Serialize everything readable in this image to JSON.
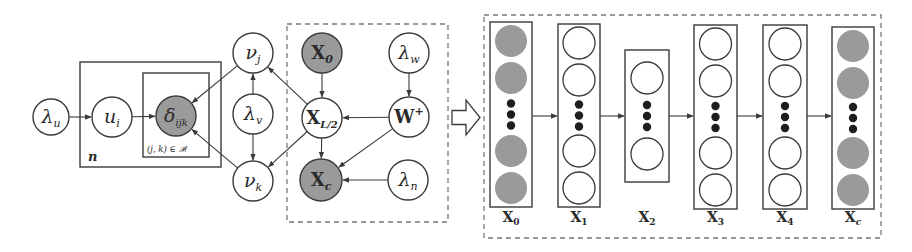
{
  "colors": {
    "stroke": "#3a3a3a",
    "observed_fill": "#9a9a9a",
    "latent_fill": "#ffffff",
    "dot": "#1e1e1e",
    "dash": "#7a7a7a"
  },
  "graphical_model": {
    "plates": [
      {
        "id": "outer",
        "label": "n",
        "x": 80,
        "y": 62,
        "w": 141,
        "h": 105
      },
      {
        "id": "inner",
        "label": "(j, k) ∈ 𝒫ᵢ",
        "x": 143,
        "y": 73,
        "w": 66,
        "h": 84
      }
    ],
    "dashed_box": {
      "x": 287,
      "y": 24,
      "w": 161,
      "h": 198
    },
    "nodes": [
      {
        "id": "lambda_u",
        "main": "λ",
        "sub": "u",
        "cx": 51,
        "cy": 117,
        "r": 18,
        "observed": false
      },
      {
        "id": "u_i",
        "main": "u",
        "sub": "i",
        "cx": 112,
        "cy": 117,
        "r": 20,
        "observed": false
      },
      {
        "id": "delta_ijk",
        "main": "δ",
        "sub": "ijk",
        "cx": 176,
        "cy": 116,
        "r": 20,
        "observed": true
      },
      {
        "id": "v_j",
        "main": "ν",
        "sub": "j",
        "cx": 253,
        "cy": 53,
        "r": 20,
        "observed": false
      },
      {
        "id": "lambda_v",
        "main": "λ",
        "sub": "v",
        "cx": 253,
        "cy": 114,
        "r": 20,
        "observed": false
      },
      {
        "id": "v_k",
        "main": "ν",
        "sub": "k",
        "cx": 253,
        "cy": 181,
        "r": 20,
        "observed": false
      },
      {
        "id": "X_0",
        "main": "X",
        "sub": "0",
        "cx": 322,
        "cy": 53,
        "r": 20,
        "observed": true,
        "upright": true
      },
      {
        "id": "X_L2",
        "main": "X",
        "sub": "L/2",
        "cx": 322,
        "cy": 118,
        "r": 20,
        "observed": false,
        "upright": true
      },
      {
        "id": "X_c",
        "main": "X",
        "sub": "c",
        "cx": 321,
        "cy": 180,
        "r": 21,
        "observed": true,
        "upright": true
      },
      {
        "id": "lambda_w",
        "main": "λ",
        "sub": "w",
        "cx": 409,
        "cy": 53,
        "r": 20,
        "observed": false
      },
      {
        "id": "W_plus",
        "main": "W",
        "sup": "+",
        "cx": 409,
        "cy": 117,
        "r": 20,
        "observed": false,
        "upright": true
      },
      {
        "id": "lambda_n",
        "main": "λ",
        "sub": "n",
        "cx": 408,
        "cy": 180,
        "r": 20,
        "observed": false
      }
    ],
    "edges": [
      {
        "from": "lambda_u",
        "to": "u_i"
      },
      {
        "from": "u_i",
        "to": "delta_ijk"
      },
      {
        "from": "v_j",
        "to": "delta_ijk"
      },
      {
        "from": "v_k",
        "to": "delta_ijk"
      },
      {
        "from": "lambda_v",
        "to": "v_j"
      },
      {
        "from": "lambda_v",
        "to": "v_k"
      },
      {
        "from": "X_L2",
        "to": "v_j"
      },
      {
        "from": "X_L2",
        "to": "v_k"
      },
      {
        "from": "X_0",
        "to": "X_L2"
      },
      {
        "from": "X_L2",
        "to": "X_c"
      },
      {
        "from": "lambda_w",
        "to": "W_plus"
      },
      {
        "from": "W_plus",
        "to": "X_L2"
      },
      {
        "from": "W_plus",
        "to": "X_c"
      },
      {
        "from": "lambda_n",
        "to": "X_c"
      }
    ]
  },
  "transition_arrow": {
    "x": 452,
    "y": 100,
    "w": 28,
    "h": 35
  },
  "network": {
    "dashed_box": {
      "x": 484,
      "y": 15,
      "w": 397,
      "h": 223
    },
    "layers": [
      {
        "label": "X",
        "sub": "0",
        "x": 490,
        "y": 22,
        "w": 42,
        "h": 185,
        "observed": true,
        "nodes": 4
      },
      {
        "label": "X",
        "sub": "1",
        "x": 558,
        "y": 24,
        "w": 42,
        "h": 183,
        "observed": false,
        "nodes": 4
      },
      {
        "label": "X",
        "sub": "2",
        "x": 625,
        "y": 50,
        "w": 44,
        "h": 132,
        "observed": false,
        "nodes": 2
      },
      {
        "label": "X",
        "sub": "3",
        "x": 694,
        "y": 25,
        "w": 43,
        "h": 184,
        "observed": false,
        "nodes": 4
      },
      {
        "label": "X",
        "sub": "4",
        "x": 763,
        "y": 25,
        "w": 44,
        "h": 184,
        "observed": false,
        "nodes": 4
      },
      {
        "label": "X",
        "sub": "c",
        "x": 832,
        "y": 27,
        "w": 42,
        "h": 182,
        "observed": true,
        "nodes": 4
      }
    ],
    "label_y": 222,
    "arrow_y": 116
  }
}
